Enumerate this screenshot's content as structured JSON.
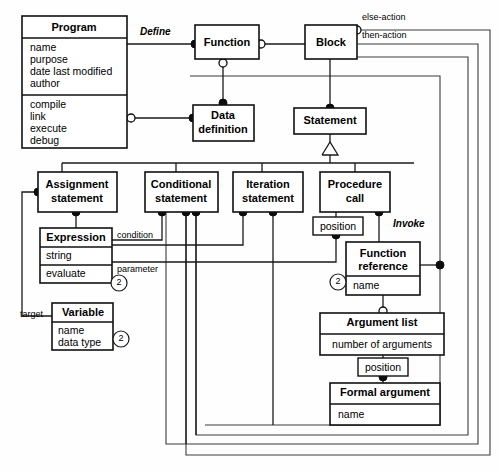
{
  "diagram": {
    "kind": "object-model-class-diagram",
    "classes": [
      {
        "id": "program",
        "title": "Program",
        "attributes": [
          "name",
          "purpose",
          "date last modified",
          "author"
        ],
        "operations": [
          "compile",
          "link",
          "execute",
          "debug"
        ]
      },
      {
        "id": "function",
        "title": "Function",
        "attributes": [],
        "operations": []
      },
      {
        "id": "block",
        "title": "Block",
        "attributes": [],
        "operations": []
      },
      {
        "id": "data_definition",
        "title_line1": "Data",
        "title_line2": "definition",
        "attributes": [],
        "operations": []
      },
      {
        "id": "statement",
        "title": "Statement",
        "attributes": [],
        "operations": []
      },
      {
        "id": "assignment_statement",
        "title_line1": "Assignment",
        "title_line2": "statement",
        "attributes": [],
        "operations": []
      },
      {
        "id": "conditional_statement",
        "title_line1": "Conditional",
        "title_line2": "statement",
        "attributes": [],
        "operations": []
      },
      {
        "id": "iteration_statement",
        "title_line1": "Iteration",
        "title_line2": "statement",
        "attributes": [],
        "operations": []
      },
      {
        "id": "procedure_call",
        "title_line1": "Procedure",
        "title_line2": "call",
        "attributes": [],
        "operations": []
      },
      {
        "id": "expression",
        "title": "Expression",
        "attributes": [
          "string"
        ],
        "operations": [
          "evaluate"
        ],
        "multiplicity": "2"
      },
      {
        "id": "variable",
        "title": "Variable",
        "attributes": [
          "name",
          "data type"
        ],
        "multiplicity": "2"
      },
      {
        "id": "function_reference",
        "title_line1": "Function",
        "title_line2": "reference",
        "attributes": [
          "name"
        ],
        "multiplicity": "2"
      },
      {
        "id": "argument_list",
        "title": "Argument list",
        "attributes": [
          "number of arguments"
        ]
      },
      {
        "id": "formal_argument",
        "title": "Formal argument",
        "attributes": [
          "name"
        ]
      }
    ],
    "link_attribute_boxes": [
      {
        "id": "position_proc",
        "label": "position"
      },
      {
        "id": "position_arg",
        "label": "position"
      }
    ],
    "association_labels": [
      {
        "id": "define",
        "text": "Define",
        "style": "italic"
      },
      {
        "id": "invoke",
        "text": "Invoke",
        "style": "italic"
      },
      {
        "id": "else_action",
        "text": "else-action",
        "style": "plain"
      },
      {
        "id": "then_action",
        "text": "then-action",
        "style": "plain"
      },
      {
        "id": "condition",
        "text": "condition",
        "style": "plain"
      },
      {
        "id": "parameter",
        "text": "parameter",
        "style": "plain"
      },
      {
        "id": "target",
        "text": "target",
        "style": "plain"
      }
    ]
  }
}
